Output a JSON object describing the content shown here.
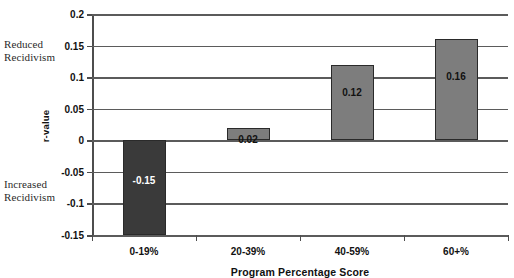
{
  "chart_data": {
    "type": "bar",
    "title": "",
    "categories": [
      "0-19%",
      "20-39%",
      "40-59%",
      "60+%"
    ],
    "values": [
      -0.15,
      0.02,
      0.12,
      0.16
    ],
    "value_labels": [
      "-0.15",
      "0.02",
      "0.12",
      "0.16"
    ],
    "xlabel": "Program Percentage Score",
    "ylabel": "r-value",
    "ylim": [
      -0.15,
      0.2
    ],
    "ytick_values": [
      0.2,
      0.15,
      0.1,
      0.05,
      0,
      -0.05,
      -0.1,
      -0.15
    ],
    "ytick_labels": [
      "0.2",
      "0.15",
      "0.1",
      "0.05",
      "0",
      "-0.05",
      "-0.1",
      "-0.15"
    ],
    "grid": "horizontal",
    "legend": "none",
    "annotations": [
      {
        "text": "Reduced\nRecidivism",
        "position": "left-upper"
      },
      {
        "text": "Increased\nRecidivism",
        "position": "left-lower"
      }
    ],
    "bar_colors": [
      "#3a3a3a",
      "#7d7d7d",
      "#7d7d7d",
      "#7d7d7d"
    ],
    "accent_color": "#7d7d7d",
    "negative_color": "#3a3a3a"
  }
}
